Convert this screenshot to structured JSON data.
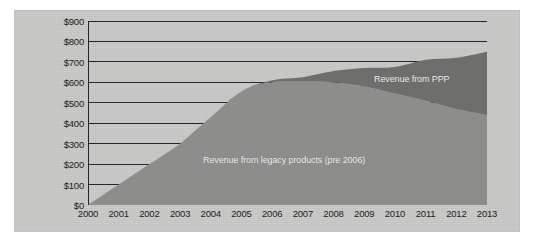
{
  "chart_data": {
    "type": "area",
    "stacked": true,
    "title": "",
    "subtitle": "",
    "xlabel": "",
    "ylabel": "",
    "grid": true,
    "legend_position": "inline-annotation",
    "x": [
      2000,
      2001,
      2002,
      2003,
      2004,
      2005,
      2006,
      2007,
      2008,
      2009,
      2010,
      2011,
      2012,
      2013
    ],
    "categories": [
      "2000",
      "2001",
      "2002",
      "2003",
      "2004",
      "2005",
      "2006",
      "2007",
      "2008",
      "2009",
      "2010",
      "2011",
      "2012",
      "2013"
    ],
    "xlim": [
      2000,
      2013
    ],
    "ylim": [
      0,
      900
    ],
    "ytick_values": [
      0,
      100,
      200,
      300,
      400,
      500,
      600,
      700,
      800,
      900
    ],
    "ytick_labels": [
      "$0",
      "$100",
      "$200",
      "$300",
      "$400",
      "$500",
      "$600",
      "$700",
      "$800",
      "$900"
    ],
    "xtick_labels": [
      "2000",
      "2001",
      "2002",
      "2003",
      "2004",
      "2005",
      "2006",
      "2007",
      "2008",
      "2009",
      "2010",
      "2011",
      "2012",
      "2013"
    ],
    "series": [
      {
        "name": "Revenue from legacy products (pre 2006)",
        "color": "#8d8d8b",
        "values": [
          0,
          100,
          200,
          300,
          430,
          555,
          600,
          605,
          600,
          580,
          545,
          510,
          470,
          440
        ]
      },
      {
        "name": "Revenue from PPP",
        "color": "#6e6e6c",
        "values": [
          0,
          0,
          0,
          0,
          0,
          0,
          10,
          20,
          55,
          90,
          130,
          200,
          250,
          310
        ]
      }
    ],
    "totals": [
      0,
      100,
      200,
      300,
      430,
      555,
      610,
      625,
      655,
      670,
      675,
      710,
      720,
      750
    ],
    "annotations": [
      {
        "text": "Revenue from legacy products (pre 2006)",
        "series": "legacy"
      },
      {
        "text": "Revenue from PPP",
        "series": "ppp"
      }
    ]
  },
  "colors": {
    "panel_background": "#c9c9c7",
    "page_background": "#ffffff",
    "gridline": "#26262a",
    "axis": "#26262a",
    "legacy_fill": "#8d8d8b",
    "ppp_fill": "#6e6e6c",
    "tick_text": "#1c1c1c",
    "annotation_text": "#f2f2f0"
  }
}
